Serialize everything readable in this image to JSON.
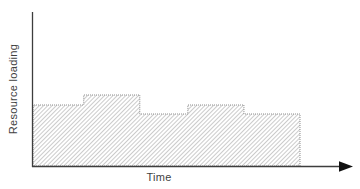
{
  "colors": {
    "background": "#ffffff",
    "axis": "#3d3d3d",
    "arrow": "#111111",
    "hatch_line": "#a0a0a0",
    "area_edge": "#8f8f8f",
    "text": "#3f3f3f"
  },
  "chart_data": {
    "type": "area",
    "subtype": "step-area resource histogram, diagonal hatch fill",
    "title": "",
    "xlabel": "Time",
    "ylabel": "Resource loading",
    "x_axis": {
      "tick_labels": [],
      "arrowhead": true
    },
    "y_axis": {
      "tick_labels": [],
      "arrowhead": false
    },
    "grid": false,
    "legend": null,
    "series": [
      {
        "name": "resource-loading-profile",
        "units": "relative (no numeric scale shown in figure)",
        "segments": [
          {
            "x0": 0.0,
            "x1": 0.19,
            "value": 61
          },
          {
            "x0": 0.19,
            "x1": 0.4,
            "value": 71
          },
          {
            "x0": 0.4,
            "x1": 0.58,
            "value": 52
          },
          {
            "x0": 0.58,
            "x1": 0.79,
            "value": 61
          },
          {
            "x0": 0.79,
            "x1": 1.0,
            "value": 52
          }
        ]
      }
    ]
  }
}
